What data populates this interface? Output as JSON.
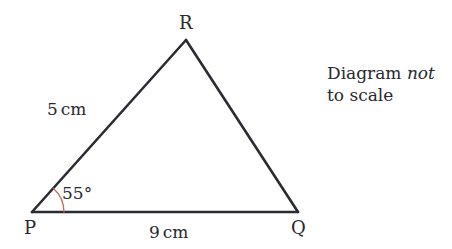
{
  "figure": {
    "type": "triangle-diagram",
    "background_color": "#ffffff",
    "line_color": "#2b2b33",
    "arc_color": "#c4695c",
    "text_color": "#29292f"
  },
  "vertices": {
    "r": {
      "label": "R",
      "x": 186,
      "y": 40
    },
    "p": {
      "label": "P",
      "x": 32,
      "y": 212
    },
    "q": {
      "label": "Q",
      "x": 298,
      "y": 212
    }
  },
  "sides": {
    "pr": {
      "value": "5",
      "unit": "cm"
    },
    "pq": {
      "value": "9",
      "unit": "cm"
    }
  },
  "angles": {
    "at_p": {
      "label": "55°",
      "degrees": 55,
      "arc_radius": 32
    }
  },
  "note": {
    "line_1_prefix": "Diagram ",
    "line_1_emphasis": "not",
    "line_2": "to scale"
  }
}
